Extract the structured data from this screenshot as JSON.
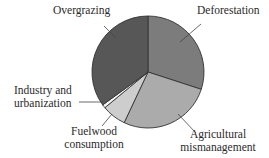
{
  "chart_data": {
    "type": "pie",
    "title": "",
    "start_angle_deg": 0,
    "direction": "clockwise",
    "slices": [
      {
        "label": "Deforestation",
        "value": 30,
        "color": "#7c7c7c"
      },
      {
        "label": "Agricultural mismanagement",
        "value": 27,
        "color": "#ababab"
      },
      {
        "label": "Fuelwood consumption",
        "value": 7,
        "color": "#cdcdcd"
      },
      {
        "label": "Industry and urbanization",
        "value": 1,
        "color": "#f4f4f4"
      },
      {
        "label": "Overgrazing",
        "value": 35,
        "color": "#575757"
      }
    ],
    "legend": "none",
    "labels_outside_with_leader_lines": true
  },
  "labels": {
    "deforestation": "Deforestation",
    "agricultural_line1": "Agricultural",
    "agricultural_line2": "mismanagement",
    "fuelwood_line1": "Fuelwood",
    "fuelwood_line2": "consumption",
    "industry_line1": "Industry and",
    "industry_line2": "urbanization",
    "overgrazing": "Overgrazing"
  }
}
